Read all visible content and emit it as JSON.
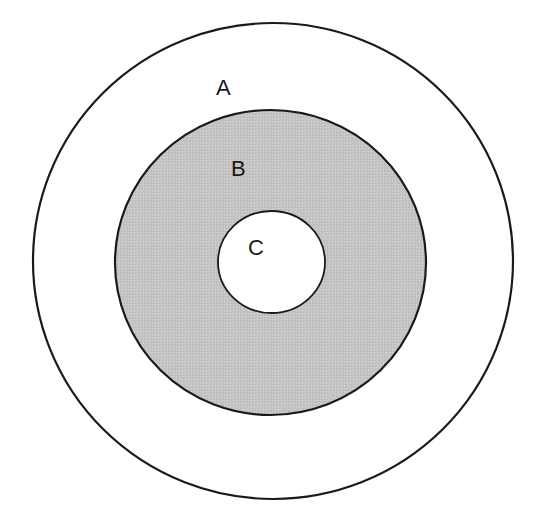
{
  "diagram": {
    "type": "nested-circles",
    "colors": {
      "background": "#ffffff",
      "stroke": "#1a1a1a",
      "outer_fill": "#ffffff",
      "middle_fill": "#c4c4c4",
      "inner_fill": "#ffffff"
    },
    "regions": [
      {
        "id": "A",
        "label": "A",
        "level": "outer"
      },
      {
        "id": "B",
        "label": "B",
        "level": "middle"
      },
      {
        "id": "C",
        "label": "C",
        "level": "inner"
      }
    ]
  }
}
